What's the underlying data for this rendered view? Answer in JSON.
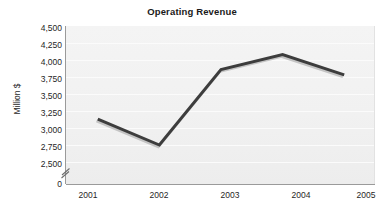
{
  "chart_data": {
    "type": "line",
    "title": "Operating Revenue",
    "xlabel": "",
    "ylabel": "Million $",
    "categories": [
      "2001",
      "2002",
      "2003",
      "2004",
      "2005"
    ],
    "x": [
      2001,
      2002,
      2003,
      2004,
      2005
    ],
    "values": [
      3130,
      2750,
      3860,
      4080,
      3780
    ],
    "series": [
      {
        "name": "Operating Revenue",
        "values": [
          3130,
          2750,
          3860,
          4080,
          3780
        ]
      }
    ],
    "ylim": [
      2500,
      4500
    ],
    "ytick_values": [
      4500,
      4250,
      4000,
      3750,
      3500,
      3250,
      3000,
      2750,
      2500,
      0
    ],
    "ytick_labels": [
      "4,500",
      "4,250",
      "4,000",
      "3,750",
      "3,500",
      "3,250",
      "3,000",
      "2,750",
      "2,500",
      "0"
    ],
    "axis_break": true,
    "axis_break_between": [
      0,
      2500
    ],
    "grid": true,
    "grid_axis": "y",
    "legend": false,
    "legend_position": "none",
    "line_color": "#3d3d3d",
    "shadow_color": "#bdbdbd",
    "plot_background": "#f1f1f1",
    "axis_color": "#9a9a9a",
    "text_color": "#1f1f1f"
  },
  "icons": {
    "axis_break_marker": "axis-break-zigzag-icon"
  }
}
